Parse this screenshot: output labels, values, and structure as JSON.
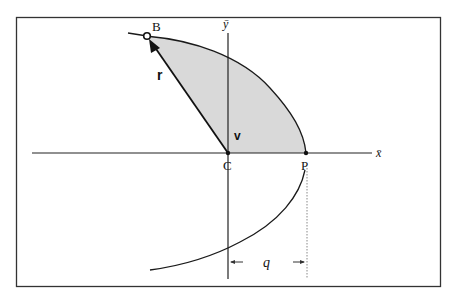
{
  "diagram": {
    "type": "orbit-geometry",
    "colors": {
      "frame": "#333333",
      "axis": "#222222",
      "curve": "#1a1a1a",
      "shaded_sector": "#d9d9d9",
      "dotted_line": "#888888"
    },
    "labels": {
      "point_b": "B",
      "point_c": "C",
      "point_p": "P",
      "radius_vector": "r",
      "true_anomaly": "v",
      "x_axis": "x̄",
      "y_axis": "ȳ",
      "periapsis_distance": "q"
    },
    "points": {
      "B": {
        "x": 147,
        "y": 36
      },
      "C": {
        "x": 228,
        "y": 153
      },
      "P": {
        "x": 306,
        "y": 153
      }
    }
  }
}
